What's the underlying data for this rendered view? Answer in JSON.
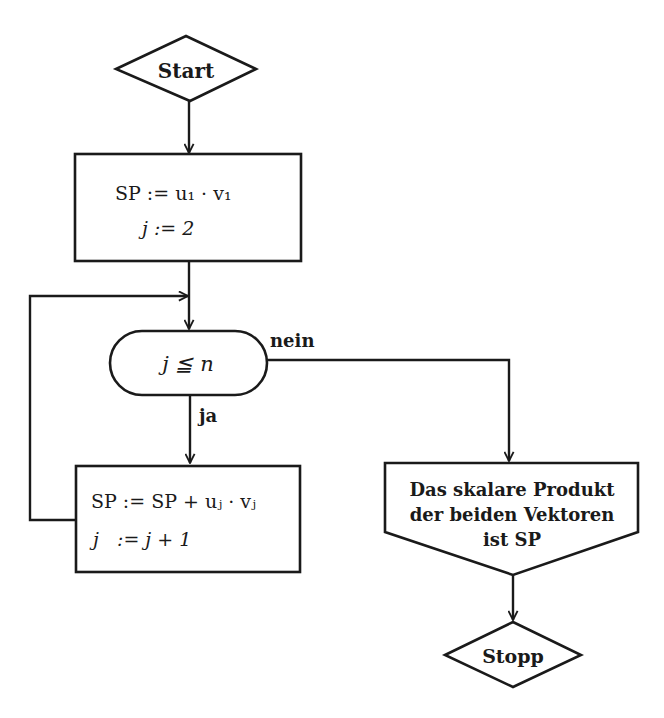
{
  "diagram": {
    "type": "flowchart",
    "language": "German",
    "nodes": {
      "start": {
        "shape": "diamond",
        "label": "Start"
      },
      "init": {
        "shape": "rectangle",
        "lines": [
          "SP := u₁ · v₁",
          "j := 2"
        ]
      },
      "condition": {
        "shape": "rounded-terminal",
        "label": "j ≦ n"
      },
      "loop_body": {
        "shape": "rectangle",
        "lines": [
          "SP := SP + uⱼ · vⱼ",
          "j   := j + 1"
        ]
      },
      "output": {
        "shape": "pentagon-down",
        "lines": [
          "Das skalare Produkt",
          "der beiden Vektoren",
          "ist SP"
        ]
      },
      "stop": {
        "shape": "diamond",
        "label": "Stopp"
      }
    },
    "edges": {
      "yes_label": "ja",
      "no_label": "nein"
    },
    "colors": {
      "line": "#1a1a1a",
      "background": "#ffffff"
    }
  }
}
